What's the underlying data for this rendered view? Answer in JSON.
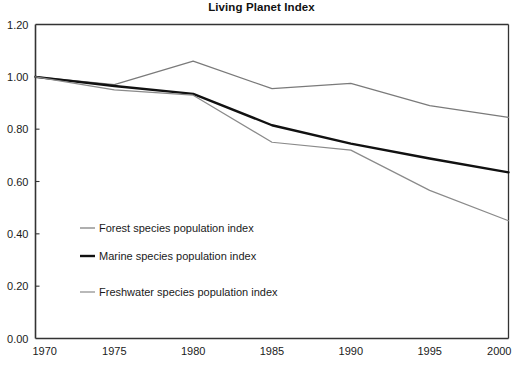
{
  "chart_data": {
    "type": "line",
    "title": "Living Planet Index",
    "xlabel": "",
    "ylabel": "",
    "x": [
      1970,
      1975,
      1980,
      1985,
      1990,
      1995,
      2000
    ],
    "xlim": [
      1970,
      2000
    ],
    "ylim": [
      0.0,
      1.2
    ],
    "xticks": [
      "1970",
      "1975",
      "1980",
      "1985",
      "1990",
      "1995",
      "2000"
    ],
    "yticks": [
      "0.00",
      "0.20",
      "0.40",
      "0.60",
      "0.80",
      "1.00",
      "1.20"
    ],
    "grid": false,
    "legend_position": "inside-lower-left",
    "series": [
      {
        "name": "Forest species population index",
        "color": "#7a7a7a",
        "width": 1.2,
        "values": [
          1.0,
          0.97,
          1.06,
          0.955,
          0.975,
          0.89,
          0.845
        ]
      },
      {
        "name": "Marine species population index",
        "color": "#111111",
        "width": 2.4,
        "values": [
          1.0,
          0.965,
          0.935,
          0.815,
          0.745,
          0.688,
          0.635
        ]
      },
      {
        "name": "Freshwater species population index",
        "color": "#8a8a8a",
        "width": 1.2,
        "values": [
          1.0,
          0.95,
          0.93,
          0.75,
          0.72,
          0.566,
          0.45
        ]
      }
    ]
  },
  "axis": {
    "frame_color": "#333333"
  },
  "title_text": "Living Planet Index"
}
